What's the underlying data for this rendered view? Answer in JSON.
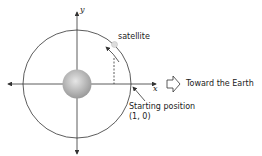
{
  "diagram": {
    "axes": {
      "x_label": "x",
      "y_label": "y"
    },
    "labels": {
      "satellite": "satellite",
      "direction": "Toward the Earth",
      "start_line1": "Starting position",
      "start_line2": "(1, 0)"
    },
    "colors": {
      "stroke": "#333333",
      "earth": "#aaaaaa"
    }
  }
}
